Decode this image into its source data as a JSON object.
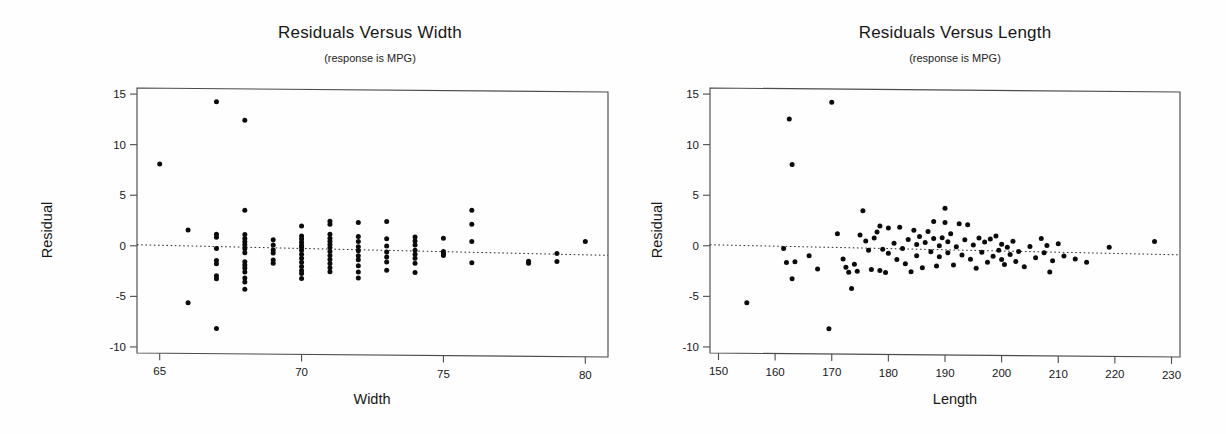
{
  "figure": {
    "background_color": "#ffffff",
    "ink_color": "#111111",
    "panel_count": 2
  },
  "chart_data": [
    {
      "type": "scatter",
      "id": "residuals-versus-width",
      "title": "Residuals Versus Width",
      "subtitle": "(response is MPG)",
      "xlabel": "Width",
      "ylabel": "Residual",
      "xlim": [
        64.2,
        80.8
      ],
      "ylim": [
        -10.6,
        15.6
      ],
      "xticks": [
        65,
        70,
        75,
        80
      ],
      "yticks": [
        15,
        10,
        5,
        0,
        -5,
        -10
      ],
      "xtick_labels": [
        "65",
        "70",
        "75",
        "80"
      ],
      "ytick_labels": [
        "15",
        "10",
        "5",
        "0",
        "-5",
        "-10"
      ],
      "grid": false,
      "legend": "none",
      "reference_line": {
        "kind": "zero-residual-dotted",
        "y_left": 0.1,
        "y_right": -0.55,
        "style": "dotted"
      },
      "marker": {
        "shape": "circle",
        "radius": 2.5,
        "color": "#0b0b0b"
      },
      "points": [
        [
          65.0,
          8.1
        ],
        [
          66.0,
          1.6
        ],
        [
          66.0,
          -5.6
        ],
        [
          67.0,
          14.3
        ],
        [
          67.0,
          1.2
        ],
        [
          67.0,
          0.9
        ],
        [
          67.0,
          -0.2
        ],
        [
          67.0,
          -1.4
        ],
        [
          67.0,
          -1.7
        ],
        [
          67.0,
          -2.9
        ],
        [
          67.0,
          -3.2
        ],
        [
          67.0,
          -8.1
        ],
        [
          68.0,
          12.5
        ],
        [
          68.0,
          3.6
        ],
        [
          68.0,
          1.2
        ],
        [
          68.0,
          0.8
        ],
        [
          68.0,
          0.5
        ],
        [
          68.0,
          0.2
        ],
        [
          68.0,
          -0.2
        ],
        [
          68.0,
          -0.6
        ],
        [
          68.0,
          -1.5
        ],
        [
          68.0,
          -1.8
        ],
        [
          68.0,
          -2.1
        ],
        [
          68.0,
          -2.5
        ],
        [
          68.0,
          -3.1
        ],
        [
          68.0,
          -3.5
        ],
        [
          68.0,
          -4.2
        ],
        [
          69.0,
          0.7
        ],
        [
          69.0,
          0.2
        ],
        [
          69.0,
          -0.3
        ],
        [
          69.0,
          -0.6
        ],
        [
          69.0,
          -1.3
        ],
        [
          69.0,
          -1.6
        ],
        [
          70.0,
          2.1
        ],
        [
          70.0,
          1.1
        ],
        [
          70.0,
          0.8
        ],
        [
          70.0,
          0.5
        ],
        [
          70.0,
          0.2
        ],
        [
          70.0,
          0.0
        ],
        [
          70.0,
          -0.3
        ],
        [
          70.0,
          -0.7
        ],
        [
          70.0,
          -1.1
        ],
        [
          70.0,
          -1.5
        ],
        [
          70.0,
          -1.9
        ],
        [
          70.0,
          -2.3
        ],
        [
          70.0,
          -2.6
        ],
        [
          70.0,
          -3.1
        ],
        [
          71.0,
          2.6
        ],
        [
          71.0,
          2.3
        ],
        [
          71.0,
          1.3
        ],
        [
          71.0,
          0.9
        ],
        [
          71.0,
          0.6
        ],
        [
          71.0,
          0.3
        ],
        [
          71.0,
          0.0
        ],
        [
          71.0,
          -0.4
        ],
        [
          71.0,
          -0.8
        ],
        [
          71.0,
          -1.2
        ],
        [
          71.0,
          -1.6
        ],
        [
          71.0,
          -2.0
        ],
        [
          71.0,
          -2.4
        ],
        [
          72.0,
          2.5
        ],
        [
          72.0,
          1.1
        ],
        [
          72.0,
          0.6
        ],
        [
          72.0,
          0.1
        ],
        [
          72.0,
          -0.3
        ],
        [
          72.0,
          -0.8
        ],
        [
          72.0,
          -1.2
        ],
        [
          72.0,
          -1.8
        ],
        [
          72.0,
          -2.4
        ],
        [
          72.0,
          -3.0
        ],
        [
          73.0,
          2.6
        ],
        [
          73.0,
          0.9
        ],
        [
          73.0,
          0.2
        ],
        [
          73.0,
          -0.4
        ],
        [
          73.0,
          -0.9
        ],
        [
          73.0,
          -1.4
        ],
        [
          73.0,
          -2.2
        ],
        [
          74.0,
          1.1
        ],
        [
          74.0,
          0.7
        ],
        [
          74.0,
          0.3
        ],
        [
          74.0,
          -0.2
        ],
        [
          74.0,
          -0.6
        ],
        [
          74.0,
          -1.0
        ],
        [
          74.0,
          -1.5
        ],
        [
          74.0,
          -2.4
        ],
        [
          75.0,
          1.0
        ],
        [
          75.0,
          -0.3
        ],
        [
          75.0,
          -0.5
        ],
        [
          75.0,
          -0.7
        ],
        [
          76.0,
          3.8
        ],
        [
          76.0,
          2.4
        ],
        [
          76.0,
          0.7
        ],
        [
          76.0,
          -1.4
        ],
        [
          78.0,
          -1.2
        ],
        [
          78.0,
          -1.4
        ],
        [
          79.0,
          -0.4
        ],
        [
          79.0,
          -1.2
        ],
        [
          80.0,
          0.8
        ]
      ]
    },
    {
      "type": "scatter",
      "id": "residuals-versus-length",
      "title": "Residuals Versus Length",
      "subtitle": "(response is MPG)",
      "xlabel": "Length",
      "ylabel": "Residual",
      "xlim": [
        148.5,
        231.5
      ],
      "ylim": [
        -10.6,
        15.6
      ],
      "xticks": [
        150,
        160,
        170,
        180,
        190,
        200,
        210,
        220,
        230
      ],
      "yticks": [
        15,
        10,
        5,
        0,
        -5,
        -10
      ],
      "xtick_labels": [
        "150",
        "160",
        "170",
        "180",
        "190",
        "200",
        "210",
        "220",
        "230"
      ],
      "ytick_labels": [
        "15",
        "10",
        "5",
        "0",
        "-5",
        "-10"
      ],
      "grid": false,
      "legend": "none",
      "reference_line": {
        "kind": "zero-residual-dotted",
        "y_left": 0.1,
        "y_right": -0.5,
        "style": "dotted"
      },
      "marker": {
        "shape": "circle",
        "radius": 2.5,
        "color": "#0b0b0b"
      },
      "points": [
        [
          155.0,
          -5.6
        ],
        [
          162.5,
          12.6
        ],
        [
          163.0,
          8.1
        ],
        [
          161.5,
          -0.2
        ],
        [
          162.0,
          -1.6
        ],
        [
          163.5,
          -1.5
        ],
        [
          163.0,
          -3.2
        ],
        [
          170.0,
          14.3
        ],
        [
          169.5,
          -8.1
        ],
        [
          166.0,
          -0.9
        ],
        [
          167.5,
          -2.2
        ],
        [
          171.0,
          1.3
        ],
        [
          172.0,
          -1.2
        ],
        [
          172.5,
          -2.0
        ],
        [
          173.0,
          -2.5
        ],
        [
          173.5,
          -4.1
        ],
        [
          174.0,
          -1.7
        ],
        [
          174.5,
          -2.4
        ],
        [
          175.0,
          1.2
        ],
        [
          175.5,
          3.6
        ],
        [
          176.0,
          0.6
        ],
        [
          176.5,
          -0.3
        ],
        [
          177.0,
          -2.2
        ],
        [
          177.5,
          0.9
        ],
        [
          178.0,
          1.5
        ],
        [
          178.5,
          2.1
        ],
        [
          178.5,
          -2.3
        ],
        [
          179.0,
          -0.2
        ],
        [
          179.5,
          -2.5
        ],
        [
          180.0,
          1.9
        ],
        [
          180.0,
          -0.6
        ],
        [
          181.0,
          0.4
        ],
        [
          181.5,
          -1.2
        ],
        [
          182.0,
          2.0
        ],
        [
          182.5,
          -0.1
        ],
        [
          183.0,
          -1.6
        ],
        [
          183.5,
          0.8
        ],
        [
          184.0,
          -2.4
        ],
        [
          184.5,
          1.7
        ],
        [
          185.0,
          0.3
        ],
        [
          185.0,
          -0.8
        ],
        [
          185.5,
          1.1
        ],
        [
          186.0,
          -2.0
        ],
        [
          186.5,
          0.5
        ],
        [
          187.0,
          1.6
        ],
        [
          187.5,
          -0.4
        ],
        [
          188.0,
          2.6
        ],
        [
          188.0,
          0.9
        ],
        [
          188.5,
          -1.8
        ],
        [
          189.0,
          0.2
        ],
        [
          189.0,
          -0.9
        ],
        [
          189.5,
          1.0
        ],
        [
          190.0,
          3.9
        ],
        [
          190.0,
          2.5
        ],
        [
          190.5,
          0.6
        ],
        [
          190.5,
          -0.5
        ],
        [
          191.0,
          1.4
        ],
        [
          191.5,
          -1.7
        ],
        [
          192.0,
          0.1
        ],
        [
          192.5,
          2.4
        ],
        [
          193.0,
          -0.7
        ],
        [
          193.5,
          0.8
        ],
        [
          194.0,
          2.3
        ],
        [
          194.5,
          -1.1
        ],
        [
          195.0,
          0.3
        ],
        [
          195.5,
          -2.0
        ],
        [
          196.0,
          1.0
        ],
        [
          196.5,
          -0.4
        ],
        [
          197.0,
          0.6
        ],
        [
          197.5,
          -1.4
        ],
        [
          198.0,
          0.9
        ],
        [
          198.5,
          -0.8
        ],
        [
          199.0,
          1.2
        ],
        [
          199.5,
          -0.2
        ],
        [
          200.0,
          0.4
        ],
        [
          200.0,
          -1.1
        ],
        [
          200.5,
          -1.6
        ],
        [
          201.0,
          0.1
        ],
        [
          201.5,
          -0.6
        ],
        [
          202.0,
          0.7
        ],
        [
          202.5,
          -1.3
        ],
        [
          203.0,
          -0.3
        ],
        [
          204.0,
          -1.8
        ],
        [
          205.0,
          0.2
        ],
        [
          206.0,
          -0.9
        ],
        [
          207.0,
          1.0
        ],
        [
          207.5,
          -0.4
        ],
        [
          208.0,
          0.3
        ],
        [
          208.5,
          -2.3
        ],
        [
          209.0,
          -1.2
        ],
        [
          210.0,
          0.5
        ],
        [
          211.0,
          -0.7
        ],
        [
          213.0,
          -1.0
        ],
        [
          215.0,
          -1.3
        ],
        [
          219.0,
          0.2
        ],
        [
          227.0,
          0.8
        ]
      ]
    }
  ]
}
